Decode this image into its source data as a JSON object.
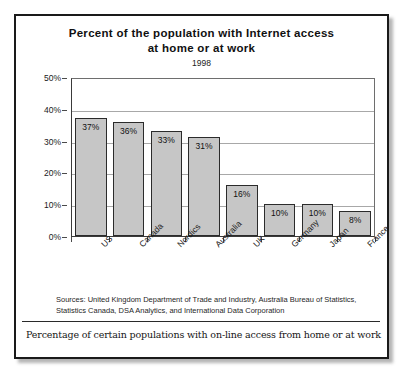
{
  "figure": {
    "title_line1": "Percent of the population with Internet access",
    "title_line2": "at home or at work",
    "subtitle": "1998",
    "sources_line1": "Sources: United Kingdom Department of Trade and Industry, Australia Bureau of Statistics,",
    "sources_line2": "Statistics Canada, DSA Analytics, and International Data Corporation",
    "caption": "Percentage of certain populations with on-line access from home or at work"
  },
  "colors": {
    "bar_fill": "#c6c6c6",
    "bar_border": "#2b2b2b",
    "gridline": "#a8a8a8",
    "frame": "#1a1a1a",
    "text": "#111111"
  },
  "chart_data": {
    "type": "bar",
    "title": "Percent of the population with Internet access at home or at work",
    "subtitle": "1998",
    "xlabel": "",
    "ylabel": "",
    "ylim": [
      0,
      50
    ],
    "grid": true,
    "legend": "none",
    "categories": [
      "US",
      "Canada",
      "Nordics",
      "Australia",
      "UK",
      "Germany",
      "Japan",
      "France"
    ],
    "values": [
      37,
      36,
      33,
      31,
      16,
      10,
      10,
      8
    ],
    "data_labels": [
      "37%",
      "36%",
      "33%",
      "31%",
      "16%",
      "10%",
      "10%",
      "8%"
    ],
    "ytick_labels": [
      "0%",
      "10%",
      "20%",
      "30%",
      "40%",
      "50%"
    ],
    "ytick_values": [
      0,
      10,
      20,
      30,
      40,
      50
    ]
  }
}
